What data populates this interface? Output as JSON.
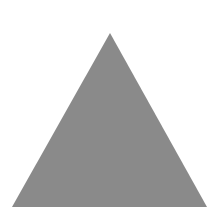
{
  "shape": {
    "type": "triangle",
    "fill": "#8a8a8a",
    "background": "#ffffff",
    "points": "110,33 12,207 207,207"
  }
}
